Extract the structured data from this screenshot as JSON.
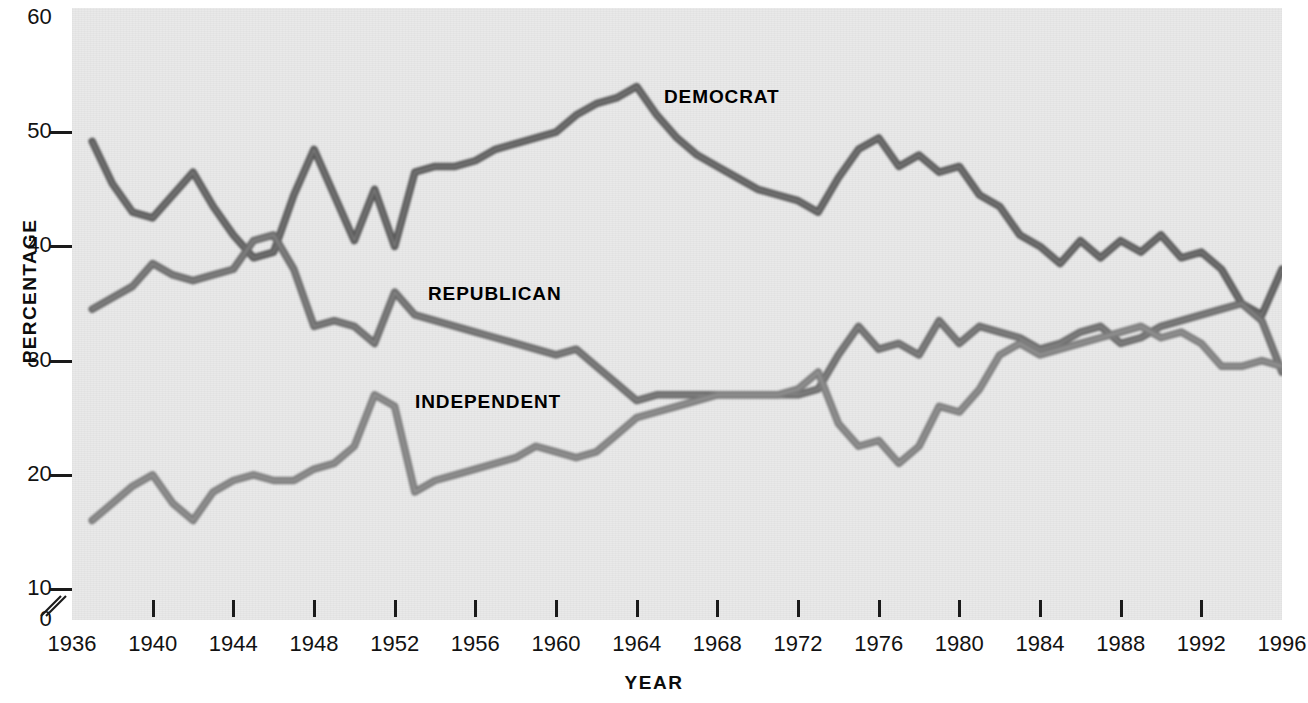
{
  "axes": {
    "ylabel": "PERCENTAGE",
    "xlabel": "YEAR",
    "yticks": [
      0,
      10,
      20,
      30,
      40,
      50,
      60
    ],
    "ytick_labels": [
      "0",
      "10",
      "20",
      "30",
      "40",
      "50",
      "60"
    ],
    "xticks": [
      1936,
      1940,
      1944,
      1948,
      1952,
      1956,
      1960,
      1964,
      1968,
      1972,
      1976,
      1980,
      1984,
      1988,
      1992,
      1996
    ],
    "xtick_labels": [
      "1936",
      "1940",
      "1944",
      "1948",
      "1952",
      "1956",
      "1960",
      "1964",
      "1968",
      "1972",
      "1976",
      "1980",
      "1984",
      "1988",
      "1992",
      "1996"
    ],
    "axis_break": true,
    "xlim": [
      1936,
      1996
    ],
    "ylim": [
      0,
      60
    ]
  },
  "annotations": {
    "democrat": "DEMOCRAT",
    "republican": "REPUBLICAN",
    "independent": "INDEPENDENT"
  },
  "colors": {
    "background": "#e9e9e9",
    "democrat": "#5a5a5a",
    "republican": "#6a6a6a",
    "independent": "#7d7d7d",
    "axis": "#1a1a1a",
    "text": "#111111"
  },
  "chart_data": {
    "type": "line",
    "title": "",
    "xlabel": "YEAR",
    "ylabel": "PERCENTAGE",
    "xlim": [
      1936,
      1996
    ],
    "ylim": [
      0,
      60
    ],
    "grid": false,
    "legend": "inline-annotations",
    "x": [
      1937,
      1938,
      1939,
      1940,
      1941,
      1942,
      1943,
      1944,
      1945,
      1946,
      1947,
      1948,
      1949,
      1950,
      1951,
      1952,
      1953,
      1954,
      1955,
      1956,
      1957,
      1958,
      1959,
      1960,
      1961,
      1962,
      1963,
      1964,
      1965,
      1966,
      1967,
      1968,
      1969,
      1970,
      1971,
      1972,
      1973,
      1974,
      1975,
      1976,
      1977,
      1978,
      1979,
      1980,
      1981,
      1982,
      1983,
      1984,
      1985,
      1986,
      1987,
      1988,
      1989,
      1990,
      1991,
      1992,
      1993,
      1994,
      1995,
      1996
    ],
    "series": [
      {
        "name": "DEMOCRAT",
        "color": "#5a5a5a",
        "values": [
          49.2,
          45.5,
          43.0,
          42.5,
          44.5,
          46.5,
          43.5,
          41.0,
          39.0,
          39.5,
          44.5,
          48.5,
          44.5,
          40.5,
          45.0,
          40.0,
          46.5,
          47.0,
          47.0,
          47.5,
          48.5,
          49.0,
          49.5,
          50.0,
          51.5,
          52.5,
          53.0,
          54.0,
          51.5,
          49.5,
          48.0,
          47.0,
          46.0,
          45.0,
          44.5,
          44.0,
          43.0,
          46.0,
          48.5,
          49.5,
          47.0,
          48.0,
          46.5,
          47.0,
          44.5,
          43.5,
          41.0,
          40.0,
          38.5,
          40.5,
          39.0,
          40.5,
          39.5,
          41.0,
          39.0,
          39.5,
          38.0,
          35.0,
          34.0,
          38.0
        ]
      },
      {
        "name": "REPUBLICAN",
        "color": "#6a6a6a",
        "values": [
          34.5,
          35.5,
          36.5,
          38.5,
          37.5,
          37.0,
          37.5,
          38.0,
          40.5,
          41.0,
          38.0,
          33.0,
          33.5,
          33.0,
          31.5,
          36.0,
          34.0,
          33.5,
          33.0,
          32.5,
          32.0,
          31.5,
          31.0,
          30.5,
          31.0,
          29.5,
          28.0,
          26.5,
          27.0,
          27.0,
          27.0,
          27.0,
          27.0,
          27.0,
          27.0,
          27.0,
          27.5,
          30.5,
          33.0,
          31.0,
          31.5,
          30.5,
          33.5,
          31.5,
          33.0,
          32.5,
          32.0,
          31.0,
          31.5,
          32.5,
          33.0,
          31.5,
          32.0,
          33.0,
          33.5,
          34.0,
          34.5,
          35.0,
          33.5,
          29.0
        ]
      },
      {
        "name": "INDEPENDENT",
        "color": "#7d7d7d",
        "values": [
          16.0,
          17.5,
          19.0,
          20.0,
          17.5,
          16.0,
          18.5,
          19.5,
          20.0,
          19.5,
          19.5,
          20.5,
          21.0,
          22.5,
          27.0,
          26.0,
          18.5,
          19.5,
          20.0,
          20.5,
          21.0,
          21.5,
          22.5,
          22.0,
          21.5,
          22.0,
          23.5,
          25.0,
          25.5,
          26.0,
          26.5,
          27.0,
          27.0,
          27.0,
          27.0,
          27.5,
          29.0,
          24.5,
          22.5,
          23.0,
          21.0,
          22.5,
          26.0,
          25.5,
          27.5,
          30.5,
          31.5,
          30.5,
          31.0,
          31.5,
          32.0,
          32.5,
          33.0,
          32.0,
          32.5,
          31.5,
          29.5,
          29.5,
          30.0,
          29.5
        ]
      }
    ]
  }
}
